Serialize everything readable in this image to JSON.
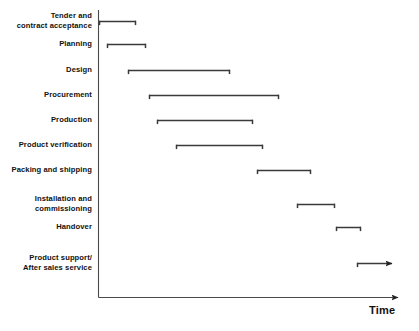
{
  "chart_data": {
    "type": "bar",
    "orientation": "horizontal",
    "subtype": "gantt",
    "title": "",
    "xlabel": "Time",
    "ylabel": "",
    "grid": false,
    "legend": null,
    "axis": {
      "x_arrow": true,
      "x_tick_labels": [],
      "y_tick_labels": [],
      "x_origin_px": 98,
      "x_end_px": 405,
      "y_top_px": 10,
      "y_bottom_px": 297
    },
    "categories": [
      "Tender and\ncontract acceptance",
      "Planning",
      "Design",
      "Procurement",
      "Production",
      "Product verification",
      "Packing and shipping",
      "Installation and\ncommissioning",
      "Handover",
      "Product support/\nAfter sales service"
    ],
    "bars": [
      {
        "label": "Tender and\ncontract acceptance",
        "start": 99,
        "end": 136,
        "y": 21,
        "arrow": false
      },
      {
        "label": "Planning",
        "start": 107,
        "end": 146,
        "y": 44,
        "arrow": false
      },
      {
        "label": "Design",
        "start": 128,
        "end": 230,
        "y": 70,
        "arrow": false
      },
      {
        "label": "Procurement",
        "start": 149,
        "end": 279,
        "y": 95,
        "arrow": false
      },
      {
        "label": "Production",
        "start": 157,
        "end": 253,
        "y": 120,
        "arrow": false
      },
      {
        "label": "Product verification",
        "start": 176,
        "end": 263,
        "y": 145,
        "arrow": false
      },
      {
        "label": "Packing and shipping",
        "start": 257,
        "end": 311,
        "y": 170,
        "arrow": false
      },
      {
        "label": "Installation and\ncommissioning",
        "start": 297,
        "end": 335,
        "y": 204,
        "arrow": false
      },
      {
        "label": "Handover",
        "start": 336,
        "end": 361,
        "y": 227,
        "arrow": false
      },
      {
        "label": "Product support/\nAfter sales service",
        "start": 357,
        "end": 399,
        "y": 263,
        "arrow": true
      }
    ]
  },
  "labels": {
    "row0": "Tender and\ncontract acceptance",
    "row1": "Planning",
    "row2": "Design",
    "row3": "Procurement",
    "row4": "Production",
    "row5": "Product verification",
    "row6": "Packing and shipping",
    "row7": "Installation and\ncommissioning",
    "row8": "Handover",
    "row9": "Product support/\nAfter sales service"
  },
  "axis_title": "Time",
  "colors": {
    "line": "#3a3a3a",
    "axis": "#4a4a4a",
    "text": "#111111",
    "background": "#ffffff"
  }
}
